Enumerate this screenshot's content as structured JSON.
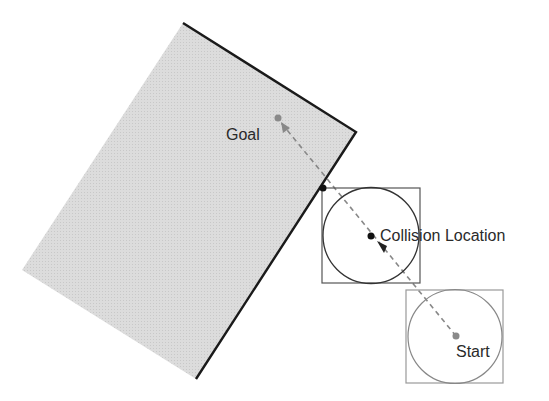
{
  "labels": {
    "goal": "Goal",
    "collision": "Collision Location",
    "start": "Start"
  },
  "colors": {
    "obstacle_fill": "#d9d9d9",
    "obstacle_edge": "#1a1a1a",
    "path": "#888888",
    "goal_dot": "#8a8a8a",
    "start_dot": "#8a8a8a",
    "collision_dot": "#111111",
    "box_collision": "#555555",
    "box_start": "#999999"
  }
}
